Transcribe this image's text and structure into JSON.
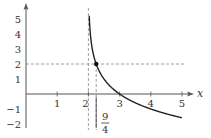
{
  "chart_data": {
    "type": "line",
    "title": "",
    "xlabel": "x",
    "ylabel": "",
    "function": "f(x) = -log2(x - 2)",
    "xlim": [
      0,
      5.3
    ],
    "ylim": [
      -2.2,
      5.6
    ],
    "x_ticks": [
      1,
      2,
      3,
      4,
      5
    ],
    "x_tick_labels": [
      "1",
      "2",
      "3",
      "4",
      "5"
    ],
    "y_ticks": [
      5,
      4,
      3,
      2,
      1,
      -1,
      -2
    ],
    "y_tick_labels": [
      "5",
      "4",
      "3",
      "2",
      "1",
      "−1",
      "−2"
    ],
    "series": [
      {
        "name": "curve",
        "x": [
          2.03,
          2.05,
          2.1,
          2.15,
          2.25,
          2.4,
          2.6,
          3.0,
          3.5,
          4.0,
          4.5,
          5.0
        ],
        "y": [
          5.06,
          4.32,
          3.32,
          2.74,
          2.0,
          1.32,
          0.74,
          0.0,
          -0.58,
          -1.0,
          -1.32,
          -1.58
        ]
      }
    ],
    "annotations": [
      {
        "type": "point",
        "x": 2.25,
        "y": 2
      },
      {
        "type": "vline-dashed",
        "x": 2,
        "label": "asymptote"
      },
      {
        "type": "vline-dashed",
        "x": 2.25
      },
      {
        "type": "hline-dashed",
        "y": 2
      },
      {
        "type": "label",
        "text_num": "9",
        "text_den": "4",
        "x": 2.25,
        "position": "below axis"
      }
    ],
    "grid": false,
    "legend": null,
    "colors": {
      "axis": "#555555",
      "curve": "#222222",
      "dashed": "#888888"
    }
  },
  "labels": {
    "x_axis": "x",
    "frac_num": "9",
    "frac_den": "4"
  }
}
